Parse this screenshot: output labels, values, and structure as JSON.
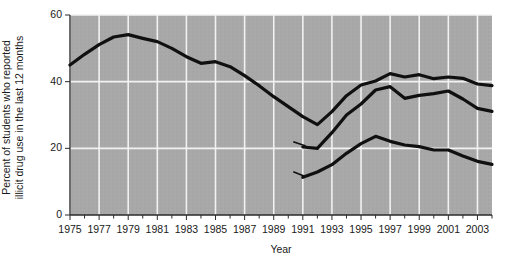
{
  "chart_data": {
    "type": "line",
    "title": "",
    "xlabel": "Year",
    "ylabel_line1": "Percent of students who reported",
    "ylabel_line2": "illicit drug use in the last 12 months",
    "ylim": [
      0,
      60
    ],
    "xlim": [
      1975,
      2004
    ],
    "ytick_labels": [
      "0",
      "20",
      "40",
      "60"
    ],
    "ytick_values": [
      0,
      20,
      40,
      60
    ],
    "grid": "vertical-and-horizontal white gridlines on gray panel",
    "legend_position": "inline annotations on plot",
    "background_color": "#a8a8a8",
    "gridline_color": "#f2f2f2",
    "line_color": "#101010",
    "x": [
      1975,
      1976,
      1977,
      1978,
      1979,
      1980,
      1981,
      1982,
      1983,
      1984,
      1985,
      1986,
      1987,
      1988,
      1989,
      1990,
      1991,
      1992,
      1993,
      1994,
      1995,
      1996,
      1997,
      1998,
      1999,
      2000,
      2001,
      2002,
      2003,
      2004
    ],
    "xtick_labels": [
      "1975",
      "1977",
      "1979",
      "1981",
      "1983",
      "1985",
      "1987",
      "1989",
      "1991",
      "1993",
      "1995",
      "1997",
      "1999",
      "2001",
      "2003"
    ],
    "xtick_label_values": [
      1975,
      1977,
      1979,
      1981,
      1983,
      1985,
      1987,
      1989,
      1991,
      1993,
      1995,
      1997,
      1999,
      2001,
      2003
    ],
    "series": [
      {
        "name": "12th grade",
        "label": "12th grade",
        "x": [
          1975,
          1976,
          1977,
          1978,
          1979,
          1980,
          1981,
          1982,
          1983,
          1984,
          1985,
          1986,
          1987,
          1988,
          1989,
          1990,
          1991,
          1992,
          1993,
          1994,
          1995,
          1996,
          1997,
          1998,
          1999,
          2000,
          2001,
          2002,
          2003,
          2004
        ],
        "values": [
          45.0,
          48.2,
          51.1,
          53.4,
          54.1,
          53.0,
          52.0,
          50.0,
          47.5,
          45.5,
          46.0,
          44.5,
          41.8,
          38.8,
          35.5,
          32.5,
          29.5,
          27.1,
          31.0,
          35.8,
          39.0,
          40.2,
          42.4,
          41.4,
          42.1,
          40.9,
          41.4,
          41.0,
          39.3,
          38.8
        ]
      },
      {
        "name": "10th grade",
        "label": "10th grade",
        "x": [
          1991,
          1992,
          1993,
          1994,
          1995,
          1996,
          1997,
          1998,
          1999,
          2000,
          2001,
          2002,
          2003,
          2004
        ],
        "values": [
          20.4,
          20.0,
          24.7,
          30.0,
          33.3,
          37.5,
          38.5,
          35.0,
          35.9,
          36.4,
          37.2,
          34.8,
          32.0,
          31.1
        ]
      },
      {
        "name": "8th grade",
        "label": "8th grade",
        "x": [
          1991,
          1992,
          1993,
          1994,
          1995,
          1996,
          1997,
          1998,
          1999,
          2000,
          2001,
          2002,
          2003,
          2004
        ],
        "values": [
          11.3,
          12.9,
          15.1,
          18.5,
          21.4,
          23.6,
          22.1,
          21.0,
          20.5,
          19.5,
          19.5,
          17.7,
          16.1,
          15.2
        ]
      }
    ],
    "annotations": [
      {
        "name": "12th grade",
        "x": 1982,
        "y": 57,
        "leader": false
      },
      {
        "name": "10th grade",
        "x": 1990,
        "y": 22,
        "leader": true
      },
      {
        "name": "8th grade",
        "x": 1990,
        "y": 13,
        "leader": true
      }
    ]
  }
}
